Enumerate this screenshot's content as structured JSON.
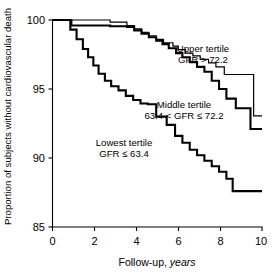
{
  "chart_data": {
    "type": "line",
    "title": "",
    "subtitle": "",
    "xlabel_plain": "Follow-up, ",
    "xlabel_italic": "years",
    "ylabel": "Proportion of subjects without cardiovascular death",
    "xlim": [
      0,
      10
    ],
    "ylim": [
      85,
      100
    ],
    "xticks": [
      "0",
      "2",
      "4",
      "6",
      "8",
      "10"
    ],
    "xtick_values": [
      0,
      2,
      4,
      6,
      8,
      10
    ],
    "yticks": [
      "85",
      "90",
      "95",
      "100"
    ],
    "ytick_values": [
      85,
      90,
      95,
      100
    ],
    "grid": false,
    "legend_position": "inline-annotations",
    "step_type": "post",
    "series": [
      {
        "name": "Upper tertile",
        "annotation_line1": "Upper tertile",
        "annotation_line2": "GFR > 72.2",
        "color": "#000000",
        "stroke_width": 1.2,
        "x": [
          0.0,
          0.55,
          2.75,
          3.55,
          3.9,
          4.25,
          4.6,
          4.95,
          5.3,
          5.75,
          6.0,
          6.35,
          6.7,
          7.05,
          7.45,
          7.8,
          8.2,
          9.35,
          9.6,
          10.0
        ],
        "y": [
          100.0,
          100.0,
          99.85,
          99.6,
          99.35,
          99.1,
          98.85,
          98.6,
          98.35,
          98.1,
          97.85,
          97.6,
          97.4,
          97.15,
          96.9,
          96.6,
          96.05,
          96.05,
          93.05,
          93.05
        ]
      },
      {
        "name": "Middle tertile",
        "annotation_line1": "Middle tertile",
        "annotation_line2": "63.4 < GFR ≤ 72.2",
        "color": "#000000",
        "stroke_width": 2.1,
        "x": [
          0.0,
          0.55,
          0.9,
          2.75,
          3.55,
          3.9,
          4.25,
          4.6,
          4.95,
          5.25,
          5.55,
          5.9,
          6.2,
          6.55,
          6.9,
          7.25,
          7.6,
          7.95,
          8.3,
          8.75,
          9.45,
          10.0
        ],
        "y": [
          100.0,
          100.0,
          99.6,
          99.55,
          99.5,
          99.25,
          99.0,
          98.75,
          98.5,
          98.25,
          97.95,
          97.6,
          97.3,
          96.95,
          96.6,
          96.25,
          95.6,
          95.0,
          94.3,
          93.6,
          92.1,
          92.1
        ]
      },
      {
        "name": "Lowest tertile",
        "annotation_line1": "Lowest tertile",
        "annotation_line2": "GFR ≤ 63.4",
        "color": "#000000",
        "stroke_width": 2.1,
        "x": [
          0.0,
          0.55,
          0.85,
          1.15,
          1.45,
          1.7,
          1.95,
          2.2,
          2.5,
          2.8,
          3.15,
          3.5,
          3.85,
          4.2,
          4.55,
          4.95,
          5.45,
          5.85,
          6.2,
          6.55,
          6.9,
          7.25,
          7.6,
          7.95,
          8.3,
          8.6,
          10.0
        ],
        "y": [
          100.0,
          100.0,
          99.3,
          98.6,
          97.9,
          97.3,
          96.7,
          96.1,
          95.6,
          95.2,
          94.9,
          94.5,
          94.2,
          93.95,
          93.9,
          93.0,
          92.4,
          91.6,
          91.1,
          90.6,
          90.2,
          89.8,
          89.4,
          89.0,
          88.5,
          87.6,
          87.6
        ]
      }
    ]
  },
  "annotations": {
    "upper": {
      "line1": "Upper tertile",
      "line2": "GFR > 72.2"
    },
    "middle": {
      "line1": "Middle tertile",
      "line2": "63.4 < GFR ≤ 72.2"
    },
    "lowest": {
      "line1": "Lowest tertile",
      "line2": "GFR ≤ 63.4"
    }
  }
}
